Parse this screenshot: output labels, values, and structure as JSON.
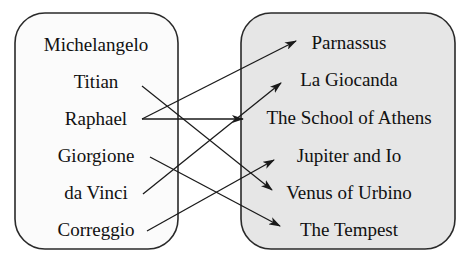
{
  "diagram": {
    "type": "bipartite-mapping",
    "left_set": {
      "name": "painters",
      "items": [
        "Michelangelo",
        "Titian",
        "Raphael",
        "Giorgione",
        "da Vinci",
        "Correggio"
      ]
    },
    "right_set": {
      "name": "paintings",
      "items": [
        "Parnassus",
        "La Giocanda",
        "The School of Athens",
        "Jupiter and Io",
        "Venus of Urbino",
        "The Tempest"
      ]
    },
    "edges": [
      {
        "from": "Titian",
        "to": "Venus of Urbino"
      },
      {
        "from": "Raphael",
        "to": "Parnassus"
      },
      {
        "from": "Raphael",
        "to": "The School of Athens"
      },
      {
        "from": "Giorgione",
        "to": "The Tempest"
      },
      {
        "from": "da Vinci",
        "to": "La Giocanda"
      },
      {
        "from": "Correggio",
        "to": "Jupiter and Io"
      }
    ],
    "colors": {
      "left_box_fill": "#fbfbfb",
      "right_box_fill": "#e6e6e6",
      "stroke": "#2a2a2a"
    }
  }
}
